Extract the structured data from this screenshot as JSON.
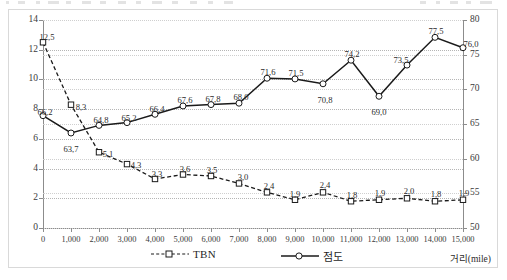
{
  "chart_data": {
    "type": "line",
    "title": "",
    "xlabel": "거리(mile)",
    "ylabel_left": "",
    "ylabel_right": "",
    "x": [
      0,
      1000,
      2000,
      3000,
      4000,
      5000,
      6000,
      7000,
      8000,
      9000,
      10000,
      11000,
      12000,
      13000,
      14000,
      15000
    ],
    "xtick_labels": [
      "0",
      "1,000",
      "2,000",
      "3,000",
      "4,000",
      "5,000",
      "6,000",
      "7,000",
      "8,000",
      "9,000",
      "10,000",
      "11,000",
      "12,000",
      "13,000",
      "14,000",
      "15,000"
    ],
    "xlim": [
      0,
      15000
    ],
    "left_axis": {
      "ticks": [
        0,
        2,
        4,
        6,
        8,
        10,
        12,
        14
      ],
      "tick_labels": [
        "0",
        "2",
        "4",
        "6",
        "8",
        "10",
        "12",
        "14"
      ],
      "lim": [
        0,
        14
      ]
    },
    "right_axis": {
      "ticks": [
        50,
        55,
        60,
        65,
        70,
        75,
        80
      ],
      "tick_labels": [
        "50",
        "55",
        "60",
        "65",
        "70",
        "75",
        "80"
      ],
      "lim": [
        50,
        80
      ]
    },
    "grid": true,
    "legend_position": "bottom",
    "series": [
      {
        "name": "TBN",
        "axis": "left",
        "line_style": "dashed",
        "marker": "open-square",
        "color": "#1a1a1a",
        "values": [
          12.5,
          8.3,
          5.1,
          4.3,
          3.3,
          3.6,
          3.5,
          3.0,
          2.4,
          1.9,
          2.4,
          1.8,
          1.9,
          2.0,
          1.8,
          1.9
        ],
        "data_labels": [
          "12,5",
          "8,3",
          "5,1",
          "4,3",
          "3,3",
          "3,6",
          "3,5",
          "3,0",
          "2,4",
          "1,9",
          "2,4",
          "1,8",
          "1,9",
          "2,0",
          "1,8",
          "1,9"
        ]
      },
      {
        "name": "점도",
        "axis": "right",
        "line_style": "solid",
        "marker": "open-circle",
        "color": "#1a1a1a",
        "values": [
          66.2,
          63.7,
          64.8,
          65.2,
          66.4,
          67.6,
          67.8,
          68.0,
          71.6,
          71.5,
          70.8,
          74.2,
          69.0,
          73.5,
          77.5,
          76.0
        ],
        "data_labels": [
          "66,2",
          "63,7",
          "64,8",
          "65,2",
          "66,4",
          "67,6",
          "67,8",
          "68,0",
          "71,6",
          "71,5",
          "70,8",
          "74,2",
          "69,0",
          "73,5",
          "77,5",
          "76,0"
        ]
      }
    ]
  },
  "legend": {
    "entries": [
      {
        "label": "TBN",
        "style": "dashed-square"
      },
      {
        "label": "점도",
        "style": "solid-circle"
      }
    ]
  },
  "axis_titles": {
    "x": "거리(mile)"
  },
  "colors": {
    "line": "#1a1a1a",
    "grid": "#b5b5b5",
    "axis": "#8c8c8c",
    "frame": "#d9d9d9",
    "text": "#2b2b2b",
    "background": "#ffffff"
  }
}
